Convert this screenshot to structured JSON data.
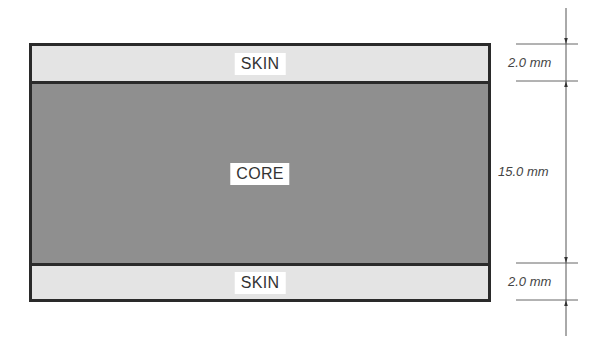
{
  "diagram": {
    "layers": [
      {
        "name": "top-skin",
        "label": "SKIN",
        "thickness_mm": 2.0,
        "fill": "#e4e4e4"
      },
      {
        "name": "core",
        "label": "CORE",
        "thickness_mm": 15.0,
        "fill": "#8f8f8f"
      },
      {
        "name": "bottom-skin",
        "label": "SKIN",
        "thickness_mm": 2.0,
        "fill": "#e4e4e4"
      }
    ],
    "dimensions": [
      {
        "for": "top-skin",
        "label": "2.0 mm"
      },
      {
        "for": "core",
        "label": "15.0 mm"
      },
      {
        "for": "bottom-skin",
        "label": "2.0 mm"
      }
    ],
    "colors": {
      "outline": "#2a2a2a",
      "skin": "#e4e4e4",
      "core": "#8f8f8f",
      "dimension_line": "#555555",
      "label_bg": "#ffffff"
    }
  }
}
